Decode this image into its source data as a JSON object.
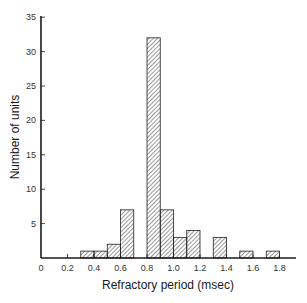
{
  "chart_data": {
    "type": "bar",
    "title": "",
    "xlabel": "Refractory period (msec)",
    "ylabel": "Number of units",
    "xlim": [
      0,
      1.9
    ],
    "ylim": [
      0,
      35
    ],
    "x_ticks": [
      "0",
      "0.2",
      "0.4",
      "0.6",
      "0.8",
      "1.0",
      "1.2",
      "1.4",
      "1.6",
      "1.8"
    ],
    "y_ticks": [
      "5",
      "10",
      "15",
      "20",
      "25",
      "30",
      "35"
    ],
    "grid": false,
    "legend": null,
    "bin_width": 0.1,
    "bins": [
      {
        "start": 0.3,
        "end": 0.4,
        "value": 1
      },
      {
        "start": 0.4,
        "end": 0.5,
        "value": 1
      },
      {
        "start": 0.5,
        "end": 0.6,
        "value": 2
      },
      {
        "start": 0.6,
        "end": 0.7,
        "value": 7
      },
      {
        "start": 0.8,
        "end": 0.9,
        "value": 32
      },
      {
        "start": 0.9,
        "end": 1.0,
        "value": 7
      },
      {
        "start": 1.0,
        "end": 1.1,
        "value": 3
      },
      {
        "start": 1.1,
        "end": 1.2,
        "value": 4
      },
      {
        "start": 1.3,
        "end": 1.4,
        "value": 3
      },
      {
        "start": 1.5,
        "end": 1.6,
        "value": 1
      },
      {
        "start": 1.7,
        "end": 1.8,
        "value": 1
      }
    ],
    "style": {
      "bar_fill": "diagonal-hatch",
      "bar_stroke": "#222222",
      "axis_color": "#1a1a1a"
    }
  }
}
